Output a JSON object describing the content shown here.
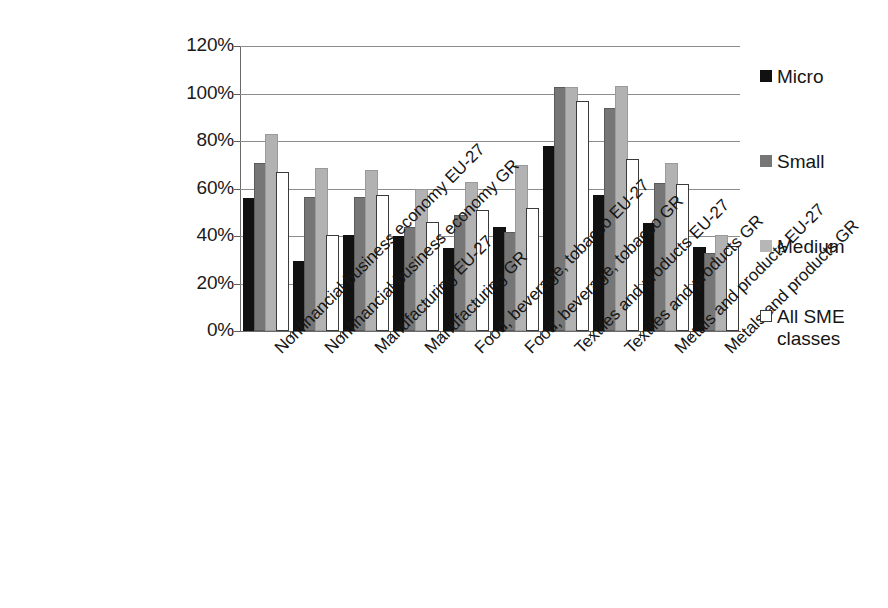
{
  "chart_data": {
    "type": "bar",
    "title": "",
    "subtitle": "",
    "xlabel": "",
    "ylabel": "",
    "ylim": [
      0,
      120
    ],
    "ytick_labels": [
      "0%",
      "20%",
      "40%",
      "60%",
      "80%",
      "100%",
      "120%"
    ],
    "ytick_values": [
      0,
      20,
      40,
      60,
      80,
      100,
      120
    ],
    "grid": "horizontal",
    "legend_position": "right",
    "value_unit": "%",
    "categories": [
      "Nonfinancial business economy EU-27",
      "Nonfinancial business economy GR",
      "Manufacturing EU-27",
      "Manufacturing GR",
      "Food, beverage, tobacco EU-27",
      "Food, beverage, tobacco GR",
      "Textiles and products EU-27",
      "Textiles and products GR",
      "Metals and products EU-27",
      "Metals and products GR"
    ],
    "series": [
      {
        "name": "Micro",
        "color": "#111111",
        "values": [
          55,
          28.5,
          39.5,
          39,
          34,
          43,
          77,
          56.5,
          44.5,
          34.5
        ]
      },
      {
        "name": "Small",
        "color": "#767676",
        "values": [
          70,
          55.5,
          55.5,
          43,
          48,
          41,
          102,
          93,
          61.5,
          32
        ]
      },
      {
        "name": "Medium",
        "color": "#b2b2b2",
        "values": [
          82,
          68,
          67,
          59,
          62,
          69,
          102,
          102.5,
          70,
          39.5
        ]
      },
      {
        "name": "All SME classes",
        "color": "#ffffff",
        "values": [
          66,
          39.5,
          56.5,
          45,
          50,
          51,
          96,
          71.5,
          61,
          35
        ]
      }
    ]
  },
  "legend": {
    "items": [
      {
        "label": "Micro",
        "swatch": "micro"
      },
      {
        "label": "Small",
        "swatch": "small"
      },
      {
        "label": "Medium",
        "swatch": "medium"
      },
      {
        "label": "All SME\nclasses",
        "swatch": "allsme"
      }
    ]
  }
}
